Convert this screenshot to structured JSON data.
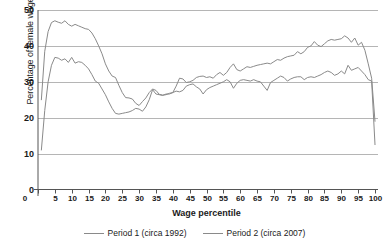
{
  "chart_data": {
    "type": "line",
    "title": "",
    "xlabel": "Wage percentile",
    "ylabel": "Percentage of female wage",
    "xlim": [
      0,
      100
    ],
    "ylim": [
      0,
      50
    ],
    "grid": true,
    "legend_position": "bottom",
    "xticks": [
      5,
      10,
      15,
      20,
      25,
      30,
      35,
      40,
      45,
      50,
      55,
      60,
      65,
      70,
      75,
      80,
      85,
      90,
      95,
      100
    ],
    "xtick_zero": "0",
    "yticks": [
      0,
      10,
      20,
      30,
      40,
      50
    ],
    "line_color": "#8a8a8a",
    "grid_color": "#b5b5b5",
    "axis_color": "#555555",
    "x": [
      1,
      2,
      3,
      4,
      5,
      6,
      7,
      8,
      9,
      10,
      11,
      12,
      13,
      14,
      15,
      16,
      17,
      18,
      19,
      20,
      21,
      22,
      23,
      24,
      25,
      26,
      27,
      28,
      29,
      30,
      31,
      32,
      33,
      34,
      35,
      36,
      37,
      38,
      39,
      40,
      41,
      42,
      43,
      44,
      45,
      46,
      47,
      48,
      49,
      50,
      51,
      52,
      53,
      54,
      55,
      56,
      57,
      58,
      59,
      60,
      61,
      62,
      63,
      64,
      65,
      66,
      67,
      68,
      69,
      70,
      71,
      72,
      73,
      74,
      75,
      76,
      77,
      78,
      79,
      80,
      81,
      82,
      83,
      84,
      85,
      86,
      87,
      88,
      89,
      90,
      91,
      92,
      93,
      94,
      95,
      96,
      97,
      98,
      99,
      100
    ],
    "series": [
      {
        "name": "Period 1 (circa 1992)",
        "label": "Period 1 (circa 1992)",
        "values": [
          25.0,
          38.5,
          44.0,
          46.5,
          47.0,
          46.6,
          46.3,
          47.0,
          46.0,
          45.5,
          46.0,
          45.6,
          45.2,
          44.8,
          44.6,
          43.6,
          42.0,
          40.0,
          37.8,
          35.0,
          33.0,
          31.6,
          31.2,
          29.0,
          27.0,
          25.6,
          25.5,
          25.2,
          24.0,
          23.4,
          24.5,
          25.5,
          27.0,
          28.0,
          27.6,
          26.5,
          26.3,
          26.4,
          26.8,
          27.0,
          28.8,
          31.0,
          30.8,
          29.8,
          30.0,
          30.4,
          31.2,
          31.5,
          31.6,
          31.2,
          31.4,
          31.0,
          32.0,
          32.6,
          31.8,
          32.6,
          34.0,
          35.0,
          33.4,
          33.0,
          33.6,
          34.2,
          34.0,
          34.3,
          34.6,
          34.8,
          35.0,
          35.2,
          35.0,
          35.6,
          36.2,
          36.0,
          36.6,
          37.0,
          37.2,
          37.4,
          38.4,
          37.8,
          38.4,
          39.6,
          40.0,
          41.2,
          40.2,
          39.8,
          40.6,
          41.4,
          41.8,
          41.6,
          41.8,
          42.0,
          42.8,
          42.2,
          41.0,
          42.2,
          40.2,
          41.0,
          38.8,
          35.0,
          31.0,
          19.0
        ]
      },
      {
        "name": "Period 2 (circa 2007)",
        "label": "Period 2 (circa 2007)",
        "values": [
          11.0,
          22.0,
          30.0,
          34.6,
          36.8,
          36.6,
          36.0,
          36.4,
          35.4,
          36.8,
          35.2,
          35.6,
          35.4,
          34.6,
          33.6,
          32.0,
          30.2,
          29.6,
          28.0,
          26.4,
          24.4,
          22.6,
          21.2,
          21.0,
          21.2,
          21.4,
          21.6,
          22.0,
          22.6,
          22.4,
          21.8,
          23.0,
          25.0,
          27.8,
          26.6,
          26.4,
          26.2,
          26.6,
          26.6,
          27.0,
          27.4,
          27.2,
          27.6,
          28.8,
          29.2,
          29.4,
          28.6,
          28.0,
          26.6,
          27.8,
          28.4,
          28.8,
          29.2,
          29.6,
          30.0,
          30.6,
          30.0,
          28.2,
          29.6,
          30.4,
          30.6,
          30.4,
          30.2,
          30.6,
          30.2,
          30.0,
          28.8,
          27.6,
          29.8,
          30.4,
          31.0,
          31.6,
          31.2,
          30.2,
          30.8,
          31.2,
          31.4,
          31.4,
          30.6,
          31.2,
          31.4,
          31.2,
          31.6,
          32.0,
          32.6,
          33.0,
          32.6,
          31.8,
          32.2,
          33.0,
          32.2,
          34.6,
          33.2,
          33.6,
          34.0,
          33.0,
          32.0,
          30.6,
          30.2,
          12.5
        ]
      }
    ]
  },
  "axes": {
    "ylabel": "Percentage of female wage",
    "xlabel": "Wage percentile",
    "yticks": [
      "50",
      "40",
      "30",
      "20",
      "10",
      "0"
    ],
    "xticks": [
      "0",
      "5",
      "10",
      "15",
      "20",
      "25",
      "30",
      "35",
      "40",
      "45",
      "50",
      "55",
      "60",
      "65",
      "70",
      "75",
      "80",
      "85",
      "90",
      "95",
      "100"
    ]
  },
  "legend": {
    "items": [
      {
        "label": "Period 1 (circa 1992)"
      },
      {
        "label": "Period 2 (circa 2007)"
      }
    ]
  }
}
